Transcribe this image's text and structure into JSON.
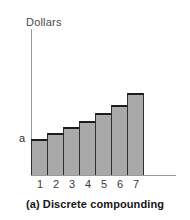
{
  "figure": {
    "caption": "(a) Discrete compounding",
    "y_axis_title": "Dollars",
    "principal_label": "a"
  },
  "colors": {
    "bar_fill": "#a9a9a9",
    "bar_outline": "#2e2e2e",
    "bar_top": "#1c1c1c",
    "axis": "#9a9a9a",
    "text": "#2b2b2b",
    "background": "#ffffff"
  },
  "chart_data": {
    "type": "bar",
    "title": "(a) Discrete compounding",
    "xlabel": "",
    "ylabel": "Dollars",
    "categories": [
      "1",
      "2",
      "3",
      "4",
      "5",
      "6",
      "7"
    ],
    "values": [
      36,
      42,
      48,
      54,
      62,
      70,
      82
    ],
    "ylim": [
      0,
      147
    ],
    "xlim": [
      0,
      7
    ],
    "grid": false,
    "legend": null,
    "annotations": [
      {
        "text": "a",
        "type": "horizontal-reference-line",
        "y": 36,
        "description": "Initial principal level 'a' marked on the y-axis with a horizontal line crossing all bars"
      }
    ]
  }
}
